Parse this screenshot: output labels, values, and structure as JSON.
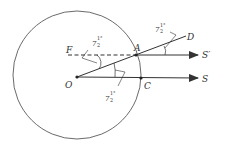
{
  "diagram": {
    "type": "geometry",
    "colors": {
      "stroke": "#333333",
      "background": "#ffffff"
    },
    "circle": {
      "cx": 77,
      "cy": 75,
      "r": 64
    },
    "points": {
      "O": {
        "label": "O",
        "x": 77,
        "y": 77
      },
      "A": {
        "label": "A",
        "x": 136,
        "y": 55
      },
      "C": {
        "label": "C",
        "x": 141,
        "y": 78
      },
      "D": {
        "label": "D",
        "x": 186,
        "y": 36
      },
      "F": {
        "label": "F",
        "x": 68,
        "y": 55
      },
      "S": {
        "label": "S",
        "x": 198,
        "y": 78
      },
      "S_prime": {
        "label": "S′",
        "x": 198,
        "y": 55
      }
    },
    "angles": [
      {
        "id": "angle-top-right",
        "main": "7",
        "frac_num": "1",
        "frac_den": "2",
        "deg": "°"
      },
      {
        "id": "angle-left",
        "main": "7",
        "frac_num": "1",
        "frac_den": "2",
        "deg": "°"
      },
      {
        "id": "angle-bottom",
        "main": "7",
        "frac_num": "1",
        "frac_den": "2",
        "deg": "°"
      }
    ]
  }
}
